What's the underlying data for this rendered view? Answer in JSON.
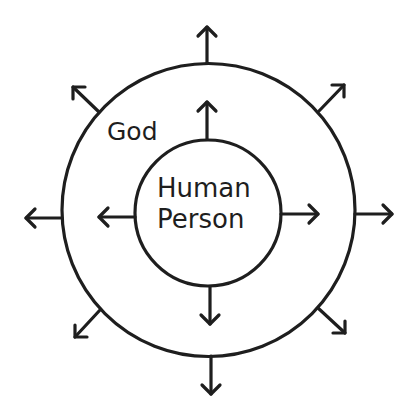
{
  "diagram": {
    "outer_label": "God",
    "inner_label_line1": "Human",
    "inner_label_line2": "Person",
    "stroke_color": "#1e1e1e",
    "background_color": "#ffffff",
    "outer_circle": {
      "cx": 208,
      "cy": 210,
      "r": 147
    },
    "inner_circle": {
      "cx": 208,
      "cy": 213,
      "r": 73
    },
    "inner_arrows": [
      "up",
      "down",
      "left",
      "right"
    ],
    "outer_arrows": [
      "up",
      "up-right",
      "right",
      "down-right",
      "down",
      "down-left",
      "left",
      "up-left"
    ]
  }
}
